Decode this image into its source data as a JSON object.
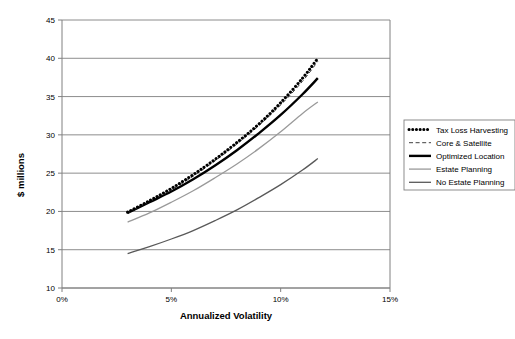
{
  "chart_data": {
    "type": "line",
    "title": "",
    "xlabel": "Annualized Volatility",
    "ylabel": "$ millions",
    "xlim": [
      0,
      15
    ],
    "ylim": [
      10,
      45
    ],
    "xticks": [
      "0%",
      "5%",
      "10%",
      "15%"
    ],
    "xtick_values": [
      0,
      5,
      10,
      15
    ],
    "yticks": [
      "10",
      "15",
      "20",
      "25",
      "30",
      "35",
      "40",
      "45"
    ],
    "ytick_values": [
      10,
      15,
      20,
      25,
      30,
      35,
      40,
      45
    ],
    "grid": "horizontal",
    "legend_position": "right",
    "x": [
      3.0,
      4.0,
      5.0,
      6.0,
      7.0,
      8.0,
      9.0,
      10.0,
      11.0,
      11.7
    ],
    "series": [
      {
        "name": "Tax Loss Harvesting",
        "style": "thick-dotted",
        "color": "#000000",
        "values": [
          19.9,
          21.4,
          23.0,
          24.8,
          26.8,
          29.0,
          31.4,
          34.2,
          37.4,
          40.0
        ]
      },
      {
        "name": "Core & Satellite",
        "style": "dashed",
        "color": "#404040",
        "values": [
          19.8,
          21.3,
          22.8,
          24.6,
          26.6,
          28.8,
          31.2,
          33.9,
          37.0,
          39.6
        ]
      },
      {
        "name": "Optimized Location",
        "style": "thick-solid",
        "color": "#000000",
        "values": [
          19.8,
          21.2,
          22.6,
          24.2,
          26.0,
          28.0,
          30.2,
          32.6,
          35.3,
          37.4
        ]
      },
      {
        "name": "Estate Planning",
        "style": "solid-light",
        "color": "#9a9a9a",
        "values": [
          18.6,
          19.8,
          21.2,
          22.7,
          24.4,
          26.2,
          28.2,
          30.4,
          32.8,
          34.3
        ]
      },
      {
        "name": "No Estate Planning",
        "style": "solid-medium",
        "color": "#595959",
        "values": [
          14.5,
          15.4,
          16.4,
          17.5,
          18.8,
          20.2,
          21.8,
          23.5,
          25.4,
          26.9
        ]
      }
    ]
  },
  "legend": {
    "items": [
      {
        "label": "Tax Loss Harvesting"
      },
      {
        "label": "Core & Satellite"
      },
      {
        "label": "Optimized Location"
      },
      {
        "label": "Estate Planning"
      },
      {
        "label": "No Estate Planning"
      }
    ]
  }
}
